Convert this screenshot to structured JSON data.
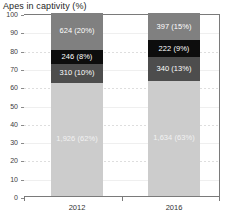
{
  "chart_data": {
    "type": "bar",
    "subtype": "stacked-100-percent",
    "title": "Apes in captivity (%)",
    "xlabel": "",
    "ylabel": "",
    "ylim": [
      0,
      100
    ],
    "ytick_step": 10,
    "yticks": [
      "0",
      "10",
      "20",
      "30",
      "40",
      "50",
      "60",
      "70",
      "80",
      "90",
      "100"
    ],
    "grid": true,
    "legend": false,
    "legend_position": "none",
    "categories": [
      "2012",
      "2016"
    ],
    "series": [
      {
        "name": "segment-1",
        "order": 1,
        "color": "#cccccc",
        "label_color": "#f2f2f2",
        "values": [
          62,
          63
        ],
        "counts": [
          "1,926",
          "1,634"
        ],
        "labels": [
          "1,926 (62%)",
          "1,634 (63%)"
        ]
      },
      {
        "name": "segment-2",
        "order": 2,
        "color": "#4d4d4d",
        "label_color": "#ffffff",
        "values": [
          10,
          13
        ],
        "counts": [
          "310",
          "340"
        ],
        "labels": [
          "310 (10%)",
          "340 (13%)"
        ]
      },
      {
        "name": "segment-3",
        "order": 3,
        "color": "#0d0d0d",
        "label_color": "#ffffff",
        "values": [
          8,
          9
        ],
        "counts": [
          "246",
          "222"
        ],
        "labels": [
          "246 (8%)",
          "222 (9%)"
        ]
      },
      {
        "name": "segment-4",
        "order": 4,
        "color": "#808080",
        "label_color": "#ffffff",
        "values": [
          20,
          15
        ],
        "counts": [
          "624",
          "397"
        ],
        "labels": [
          "624 (20%)",
          "397 (15%)"
        ]
      }
    ]
  }
}
